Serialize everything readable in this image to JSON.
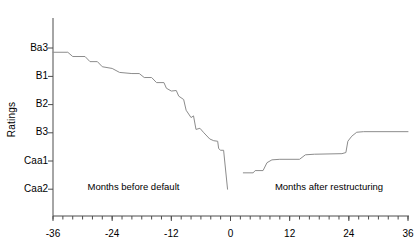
{
  "chart_data": {
    "type": "line",
    "title": "",
    "subtitle": "",
    "xlabel": "",
    "ylabel": "Ratings",
    "grid": false,
    "legend": "none",
    "line_color": "#8c8c8c",
    "axis_color": "#4d4d4d",
    "background": "#ffffff",
    "xlim": [
      -36,
      36
    ],
    "xticks": [
      -36,
      -24,
      -12,
      0,
      12,
      24,
      36
    ],
    "xtick_labels": [
      "-36",
      "-24",
      "-12",
      "0",
      "12",
      "24",
      "36"
    ],
    "x_minor_tick_interval": 2,
    "ylim_categories": [
      "Ba3",
      "B1",
      "B2",
      "B3",
      "Caa1",
      "Caa2"
    ],
    "yticks": [
      0,
      1,
      2,
      3,
      4,
      5
    ],
    "ytick_labels": [
      "Ba3",
      "B1",
      "B2",
      "B3",
      "Caa1",
      "Caa2"
    ],
    "y_axis_direction": "inverted-quality-downward",
    "annotations": [
      {
        "text": "Months before default",
        "x": -29,
        "y_category": "Caa2"
      },
      {
        "text": "Months after restructuring",
        "x": 9,
        "y_category": "Caa2"
      }
    ],
    "series": [
      {
        "name": "Average rating before default",
        "x_range": [
          -36,
          0
        ],
        "points": [
          {
            "x": -36.0,
            "y": 0.15
          },
          {
            "x": -33.0,
            "y": 0.15
          },
          {
            "x": -32.0,
            "y": 0.3
          },
          {
            "x": -29.5,
            "y": 0.3
          },
          {
            "x": -28.5,
            "y": 0.48
          },
          {
            "x": -27.0,
            "y": 0.48
          },
          {
            "x": -26.0,
            "y": 0.66
          },
          {
            "x": -24.0,
            "y": 0.72
          },
          {
            "x": -22.5,
            "y": 0.86
          },
          {
            "x": -20.0,
            "y": 0.9
          },
          {
            "x": -18.5,
            "y": 0.9
          },
          {
            "x": -17.5,
            "y": 1.04
          },
          {
            "x": -16.0,
            "y": 1.04
          },
          {
            "x": -15.0,
            "y": 1.22
          },
          {
            "x": -13.5,
            "y": 1.22
          },
          {
            "x": -13.0,
            "y": 1.42
          },
          {
            "x": -12.0,
            "y": 1.52
          },
          {
            "x": -11.0,
            "y": 1.5
          },
          {
            "x": -10.5,
            "y": 1.7
          },
          {
            "x": -9.5,
            "y": 1.82
          },
          {
            "x": -9.0,
            "y": 2.2
          },
          {
            "x": -8.0,
            "y": 2.46
          },
          {
            "x": -7.5,
            "y": 2.4
          },
          {
            "x": -7.0,
            "y": 2.88
          },
          {
            "x": -6.2,
            "y": 2.84
          },
          {
            "x": -5.4,
            "y": 3.0
          },
          {
            "x": -4.2,
            "y": 3.22
          },
          {
            "x": -3.4,
            "y": 3.28
          },
          {
            "x": -2.6,
            "y": 3.3
          },
          {
            "x": -2.4,
            "y": 3.56
          },
          {
            "x": -2.0,
            "y": 3.62
          },
          {
            "x": -1.4,
            "y": 3.62
          },
          {
            "x": -0.6,
            "y": 5.0
          }
        ]
      },
      {
        "name": "Average rating after restructuring",
        "x_range": [
          1,
          36
        ],
        "points": [
          {
            "x": 2.6,
            "y": 4.42
          },
          {
            "x": 4.6,
            "y": 4.42
          },
          {
            "x": 5.0,
            "y": 4.34
          },
          {
            "x": 6.6,
            "y": 4.34
          },
          {
            "x": 7.4,
            "y": 4.06
          },
          {
            "x": 8.4,
            "y": 3.96
          },
          {
            "x": 10.0,
            "y": 3.94
          },
          {
            "x": 14.0,
            "y": 3.94
          },
          {
            "x": 15.2,
            "y": 3.78
          },
          {
            "x": 17.0,
            "y": 3.76
          },
          {
            "x": 22.6,
            "y": 3.74
          },
          {
            "x": 23.4,
            "y": 3.7
          },
          {
            "x": 23.8,
            "y": 3.3
          },
          {
            "x": 24.6,
            "y": 3.12
          },
          {
            "x": 25.6,
            "y": 2.98
          },
          {
            "x": 27.0,
            "y": 2.96
          },
          {
            "x": 36.0,
            "y": 2.96
          }
        ]
      }
    ]
  }
}
